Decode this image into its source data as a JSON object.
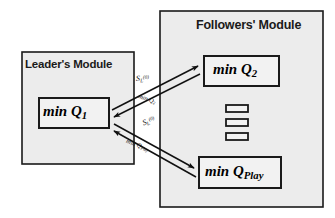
{
  "figure": {
    "background_color": "#ffffff",
    "module_fill": "#ececec",
    "node_fill": "#f2f2f2",
    "stroke_color": "#1a1a1a"
  },
  "modules": [
    {
      "id": "leader",
      "title": "Leader's Module",
      "x": 22,
      "y": 52,
      "w": 112,
      "h": 112
    },
    {
      "id": "followers",
      "title": "Followers' Module",
      "x": 160,
      "y": 11,
      "w": 163,
      "h": 196
    }
  ],
  "nodes": [
    {
      "id": "q1",
      "prefix": "min Q",
      "subscript": "1",
      "x": 39,
      "y": 98,
      "w": 70,
      "h": 30
    },
    {
      "id": "q2",
      "prefix": "min Q",
      "subscript": "2",
      "x": 204,
      "y": 56,
      "w": 75,
      "h": 30
    },
    {
      "id": "qplay",
      "prefix": "min Q",
      "subscript": "Play",
      "x": 199,
      "y": 157,
      "w": 82,
      "h": 31
    }
  ],
  "ellipsis_marks": [
    {
      "x": 226,
      "y": 105,
      "w": 22,
      "h": 7
    },
    {
      "x": 226,
      "y": 119,
      "w": 22,
      "h": 7
    },
    {
      "x": 226,
      "y": 133,
      "w": 22,
      "h": 7
    }
  ],
  "edges": [
    {
      "id": "leader-to-q2",
      "from": "q1",
      "to": "q2",
      "label": {
        "text": "S",
        "subscript": "L",
        "superscript": "(0)"
      }
    },
    {
      "id": "q2-to-leader",
      "from": "q2",
      "to": "q1",
      "label": {
        "text": "min Q",
        "subscript": "2"
      }
    },
    {
      "id": "leader-to-qplay",
      "from": "q1",
      "to": "qplay",
      "label": {
        "text": "S",
        "subscript": "L",
        "superscript": "(0)"
      }
    },
    {
      "id": "qplay-to-leader",
      "from": "qplay",
      "to": "q1",
      "label": {
        "text": "min Q",
        "subscript": "Play"
      }
    }
  ],
  "edge_labels": {
    "s_top_base": "S",
    "s_top_sub": "L",
    "s_top_sup": "(0)",
    "q2_base": "min Q",
    "q2_sub": "2",
    "s_bot_base": "S",
    "s_bot_sub": "L",
    "s_bot_sup": "(0)",
    "qplay_base": "min Q",
    "qplay_sub": "Play"
  },
  "node_text": {
    "q1_prefix": "min Q",
    "q1_sub": "1",
    "q2_prefix": "min Q",
    "q2_sub": "2",
    "qplay_prefix": "min Q",
    "qplay_sub": "Play"
  },
  "titles": {
    "leader": "Leader's Module",
    "followers": "Followers' Module"
  }
}
